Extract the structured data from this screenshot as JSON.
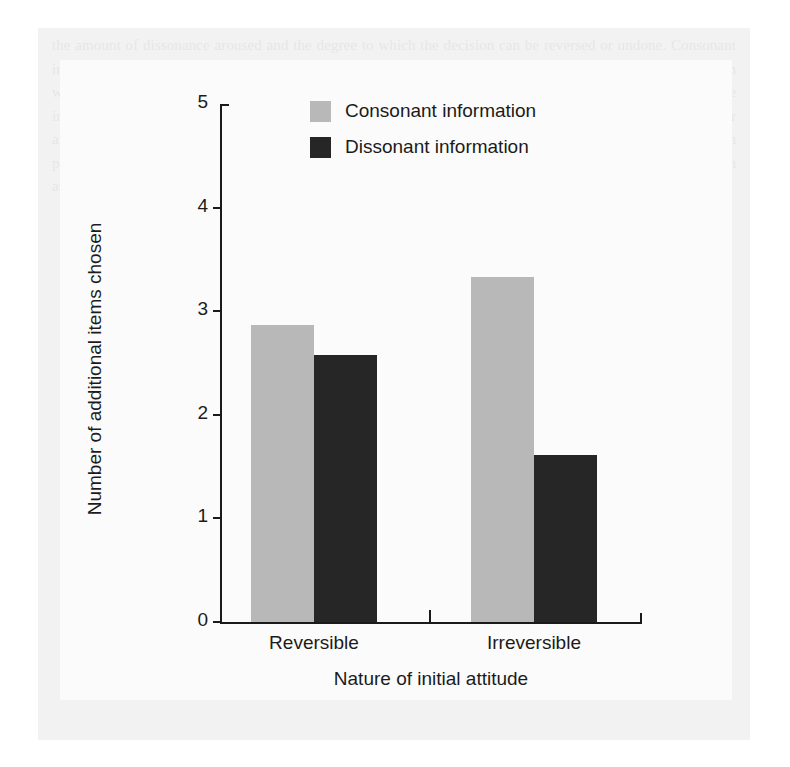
{
  "chart_data": {
    "type": "bar",
    "title": "",
    "xlabel": "Nature of initial attitude",
    "ylabel": "Number of additional items chosen",
    "categories": [
      "Reversible",
      "Irreversible"
    ],
    "series": [
      {
        "name": "Consonant information",
        "color": "#b8b8b8",
        "values": [
          2.87,
          3.33
        ]
      },
      {
        "name": "Dissonant information",
        "color": "#262626",
        "values": [
          2.58,
          1.61
        ]
      }
    ],
    "ylim": [
      0,
      5
    ],
    "yticks": [
      0,
      1,
      2,
      3,
      4,
      5
    ],
    "ytick_labels": [
      "0",
      "1",
      "2",
      "3",
      "4",
      "5"
    ],
    "grid": false,
    "legend_position": "top-center"
  },
  "legend": {
    "items": [
      {
        "label": "Consonant information",
        "color": "#b8b8b8"
      },
      {
        "label": "Dissonant information",
        "color": "#262626"
      }
    ]
  },
  "axes": {
    "y_title": "Number of additional items chosen",
    "x_title": "Nature of initial attitude",
    "y_labels": [
      "5",
      "4",
      "3",
      "2",
      "1",
      "0"
    ],
    "x_labels": [
      "Reversible",
      "Irreversible"
    ]
  },
  "background": {
    "ghost_text": "the amount of dissonance aroused and the degree to which the decision can be reversed or undone. Consonant information supporting the chosen alternative was sought more often when the decision was irreversible than when it could be reversed, whereas dissonant information about the rejected alternative was avoided in the irreversible condition. These findings indicate that the motivation to reduce dissonance is substantially stronger after a commitment has been finalized and the person can no longer change course. In the reversible condition participants showed a relatively balanced interest in both consonant and dissonant information, consistent with an accuracy motive rather than a defensive one."
  }
}
